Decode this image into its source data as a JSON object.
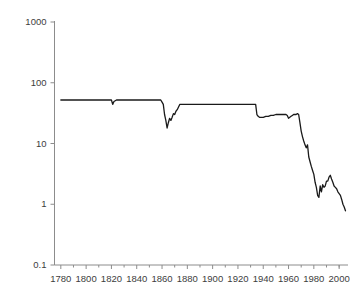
{
  "chart_data": {
    "type": "line",
    "title": "",
    "subtitle": "",
    "xlabel": "",
    "ylabel": "",
    "yscale": "log",
    "xscale": "linear",
    "grid": false,
    "legend": null,
    "xlim": [
      1775,
      2007
    ],
    "ylim": [
      0.1,
      1000
    ],
    "xticks": [
      1780,
      1800,
      1820,
      1840,
      1860,
      1880,
      1900,
      1920,
      1940,
      1960,
      1980,
      2000
    ],
    "xtick_labels": [
      "1780",
      "1800",
      "1820",
      "1840",
      "1860",
      "1880",
      "1900",
      "1920",
      "1940",
      "1960",
      "1980",
      "2000"
    ],
    "xminor_ticks": [
      1790,
      1810,
      1830,
      1850,
      1870,
      1890,
      1910,
      1930,
      1950,
      1970,
      1990,
      2000
    ],
    "yticks": [
      0.1,
      1,
      10,
      100,
      1000
    ],
    "ytick_labels": [
      "0.1",
      "1",
      "10",
      "100",
      "1000"
    ],
    "line_color": "#1a1a1a",
    "axis_color": "#8c8c8c",
    "background_color": "#ffffff",
    "series": [
      {
        "name": "value",
        "x": [
          1780,
          1790,
          1800,
          1808,
          1812,
          1815,
          1818,
          1820,
          1821,
          1822,
          1824,
          1828,
          1834,
          1840,
          1845,
          1848,
          1849,
          1850,
          1852,
          1854,
          1856,
          1858,
          1859,
          1860,
          1861,
          1862,
          1863,
          1864,
          1865,
          1866,
          1867,
          1868,
          1869,
          1870,
          1871,
          1872,
          1874,
          1876,
          1878,
          1880,
          1885,
          1890,
          1895,
          1900,
          1905,
          1910,
          1915,
          1920,
          1925,
          1928,
          1930,
          1932,
          1933,
          1934,
          1935,
          1936,
          1937,
          1938,
          1940,
          1942,
          1944,
          1946,
          1948,
          1950,
          1952,
          1954,
          1956,
          1958,
          1959,
          1960,
          1961,
          1962,
          1963,
          1964,
          1965,
          1966,
          1967,
          1968,
          1969,
          1970,
          1971,
          1972,
          1973,
          1974,
          1975,
          1976,
          1977,
          1978,
          1979,
          1980,
          1981,
          1982,
          1983,
          1984,
          1985,
          1986,
          1987,
          1988,
          1989,
          1990,
          1991,
          1992,
          1993,
          1994,
          1995,
          1996,
          1997,
          1998,
          1999,
          2000,
          2001,
          2002,
          2003,
          2004,
          2005
        ],
        "y": [
          52,
          52,
          52,
          52,
          52,
          52,
          52,
          52,
          44,
          49,
          52,
          52,
          52,
          52,
          52,
          52,
          52,
          52,
          52,
          52,
          52,
          52,
          52,
          48,
          44,
          30,
          24,
          18,
          22,
          26,
          24,
          27,
          31,
          30,
          34,
          36,
          44,
          44,
          44,
          44,
          44,
          44,
          44,
          44,
          44,
          44,
          44,
          44,
          44,
          44,
          44,
          44,
          44,
          44,
          30,
          28,
          27,
          27,
          27,
          28,
          28,
          29,
          29,
          30,
          30,
          30,
          30,
          30,
          29,
          26,
          27,
          28,
          29,
          30,
          30,
          30,
          31,
          30,
          22,
          16,
          13,
          11,
          9.5,
          8.5,
          9.5,
          6.0,
          5.0,
          4.2,
          3.6,
          3.1,
          2.3,
          1.9,
          1.4,
          1.3,
          2.0,
          1.6,
          2.1,
          1.9,
          2.0,
          2.4,
          2.4,
          2.8,
          3.0,
          2.6,
          2.3,
          2.0,
          1.9,
          1.8,
          1.6,
          1.5,
          1.4,
          1.2,
          1.0,
          0.9,
          0.78
        ]
      }
    ]
  }
}
